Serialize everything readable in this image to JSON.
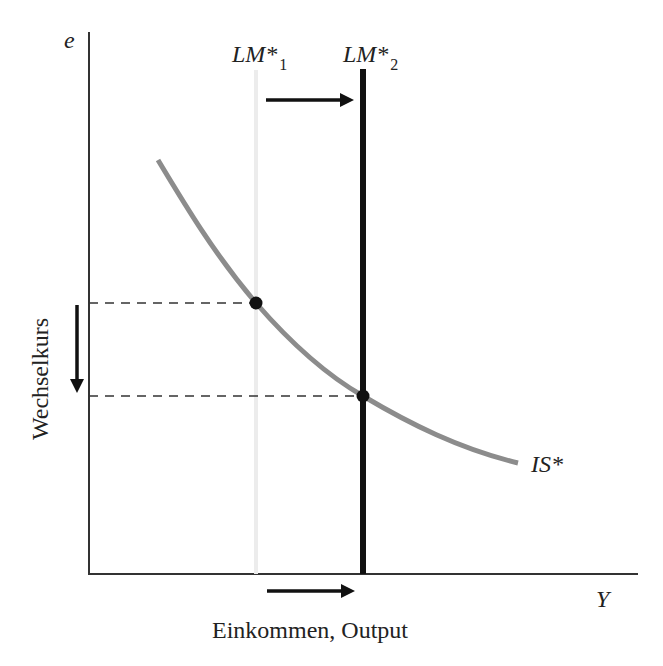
{
  "diagram": {
    "y_axis": {
      "symbol": "e",
      "label": "Wechselkurs"
    },
    "x_axis": {
      "symbol": "Y",
      "label": "Einkommen, Output"
    },
    "curves": {
      "lm1": {
        "label": "LM*",
        "subscript": "1"
      },
      "lm2": {
        "label": "LM*",
        "subscript": "2"
      },
      "is": {
        "label": "IS*"
      }
    },
    "equilibria": [
      {
        "name": "initial",
        "on": "LM*1 ∩ IS*"
      },
      {
        "name": "new",
        "on": "LM*2 ∩ IS*"
      }
    ],
    "arrows": {
      "lm_shift": "right",
      "exchange_rate": "down",
      "income": "right"
    },
    "colors": {
      "axis": "#333333",
      "is_curve": "#8c8c8c",
      "lm2": "#111111",
      "lm1": "#e6e6e6",
      "dashed": "#333333"
    }
  }
}
